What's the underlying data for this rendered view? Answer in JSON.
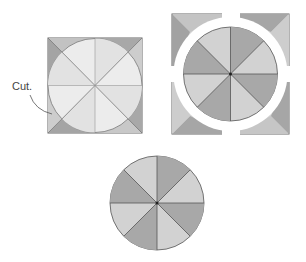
{
  "diagram": {
    "labels": {
      "cut": "Cut."
    },
    "colors": {
      "light": "#ebebeb",
      "mid": "#cfcfcf",
      "dark": "#a9a9a9",
      "stroke": "#555555",
      "corner_light": "#d0d0d0",
      "corner_dark": "#9e9e9e"
    },
    "steps": [
      {
        "name": "square-with-inscribed-circle",
        "segments": 8
      },
      {
        "name": "circle-separated-from-corners",
        "segments": 8
      },
      {
        "name": "finished-circle",
        "segments": 8
      }
    ]
  }
}
